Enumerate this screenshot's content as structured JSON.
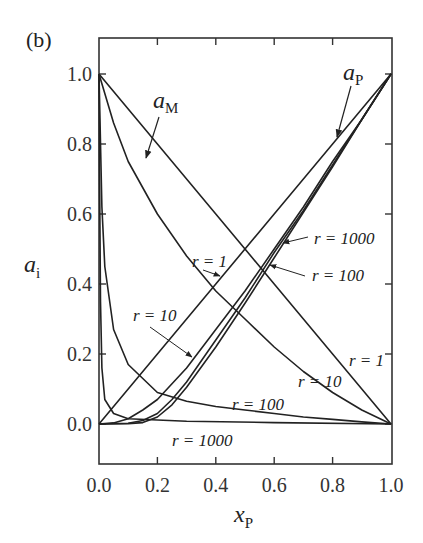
{
  "chart_data": {
    "type": "line",
    "panel_label": "(b)",
    "xlabel": "x_P",
    "ylabel": "a_i",
    "xlim": [
      0.0,
      1.0
    ],
    "ylim": [
      -0.1,
      1.1
    ],
    "xticks": [
      "0.0",
      "0.2",
      "0.4",
      "0.6",
      "0.8",
      "1.0"
    ],
    "yticks": [
      "0.0",
      "0.2",
      "0.4",
      "0.6",
      "0.8",
      "1.0"
    ],
    "grid": false,
    "legend": "none (inline annotations)",
    "series": [
      {
        "name": "a_M, r = 1",
        "x": [
          0,
          0.2,
          0.4,
          0.6,
          0.8,
          1.0
        ],
        "y": [
          1.0,
          0.8,
          0.6,
          0.4,
          0.2,
          0.0
        ]
      },
      {
        "name": "a_M, r = 10",
        "x": [
          0,
          0.05,
          0.1,
          0.2,
          0.3,
          0.4,
          0.5,
          0.6,
          0.7,
          0.8,
          0.9,
          1.0
        ],
        "y": [
          1.0,
          0.86,
          0.75,
          0.6,
          0.48,
          0.38,
          0.3,
          0.22,
          0.15,
          0.09,
          0.04,
          0.0
        ]
      },
      {
        "name": "a_M, r = 100",
        "x": [
          0,
          0.01,
          0.02,
          0.05,
          0.1,
          0.2,
          0.3,
          0.4,
          0.5,
          0.6,
          0.7,
          0.8,
          0.9,
          1.0
        ],
        "y": [
          1.0,
          0.62,
          0.45,
          0.27,
          0.17,
          0.09,
          0.065,
          0.05,
          0.04,
          0.03,
          0.02,
          0.013,
          0.006,
          0.0
        ]
      },
      {
        "name": "a_M, r = 1000",
        "x": [
          0,
          0.002,
          0.005,
          0.01,
          0.02,
          0.05,
          0.1,
          0.3,
          0.6,
          1.0
        ],
        "y": [
          1.0,
          0.7,
          0.35,
          0.16,
          0.07,
          0.03,
          0.015,
          0.008,
          0.004,
          0.0
        ]
      },
      {
        "name": "a_P, r = 1",
        "x": [
          0,
          0.2,
          0.4,
          0.6,
          0.8,
          1.0
        ],
        "y": [
          0.0,
          0.2,
          0.4,
          0.6,
          0.8,
          1.0
        ]
      },
      {
        "name": "a_P, r = 10",
        "x": [
          0,
          0.05,
          0.1,
          0.15,
          0.2,
          0.3,
          0.4,
          0.5,
          0.6,
          0.7,
          0.8,
          0.9,
          1.0
        ],
        "y": [
          0.0,
          0.003,
          0.015,
          0.04,
          0.07,
          0.16,
          0.27,
          0.38,
          0.5,
          0.62,
          0.75,
          0.87,
          1.0
        ]
      },
      {
        "name": "a_P, r = 100",
        "x": [
          0,
          0.1,
          0.15,
          0.2,
          0.25,
          0.3,
          0.4,
          0.5,
          0.6,
          0.7,
          0.8,
          0.9,
          1.0
        ],
        "y": [
          0.0,
          0.002,
          0.01,
          0.03,
          0.07,
          0.12,
          0.24,
          0.36,
          0.49,
          0.61,
          0.74,
          0.87,
          1.0
        ]
      },
      {
        "name": "a_P, r = 1000",
        "x": [
          0,
          0.1,
          0.15,
          0.2,
          0.25,
          0.3,
          0.4,
          0.5,
          0.6,
          0.7,
          0.8,
          0.9,
          1.0
        ],
        "y": [
          0.0,
          0.001,
          0.004,
          0.02,
          0.055,
          0.105,
          0.22,
          0.345,
          0.475,
          0.605,
          0.735,
          0.87,
          1.0
        ]
      }
    ],
    "annotations": [
      {
        "text": "a_M",
        "points_to": "a_M curves (upper left)"
      },
      {
        "text": "a_P",
        "points_to": "a_P curves (upper right)"
      },
      {
        "text": "r = 1",
        "near": "crossing of r=1 lines, left-middle"
      },
      {
        "text": "r = 1000",
        "near": "a_P r=1000 curve, right"
      },
      {
        "text": "r = 100",
        "near": "a_P r=100 curve, right"
      },
      {
        "text": "r = 10",
        "near": "a_P r=10 curve, lower left"
      },
      {
        "text": "r = 1",
        "near": "a_M r=1 line, right side"
      },
      {
        "text": "r = 10",
        "near": "a_M r=10 curve, lower right"
      },
      {
        "text": "r = 100",
        "near": "a_M r=100 curve, bottom"
      },
      {
        "text": "r = 1000",
        "near": "a_M r=1000 curve, below baseline"
      }
    ]
  },
  "labels": {
    "panel": "(b)",
    "ylabel_main": "a",
    "ylabel_sub": "i",
    "xlabel_main": "x",
    "xlabel_sub": "P",
    "aM_main": "a",
    "aM_sub": "M",
    "aP_main": "a",
    "aP_sub": "P",
    "r1_left": "r = 1",
    "r1000_right": "r = 1000",
    "r100_right": "r = 100",
    "r10_left": "r = 10",
    "r1_right": "r = 1",
    "r10_right": "r = 10",
    "r100_bottom": "r = 100",
    "r1000_bottom": "r = 1000"
  },
  "style": {
    "line_color": "#222222",
    "frame_color": "#333333"
  }
}
